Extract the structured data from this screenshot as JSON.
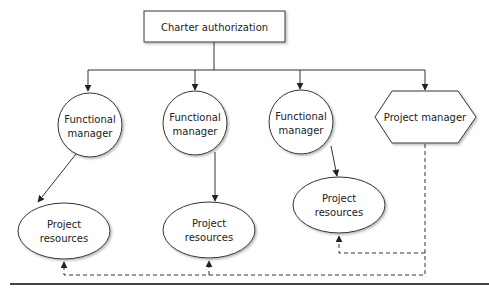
{
  "diagram": {
    "type": "organizational-flow",
    "top_node": {
      "label": "Charter authorization",
      "shape": "rectangle"
    },
    "managers": [
      {
        "label_line1": "Functional",
        "label_line2": "manager",
        "shape": "circle"
      },
      {
        "label_line1": "Functional",
        "label_line2": "manager",
        "shape": "circle"
      },
      {
        "label_line1": "Functional",
        "label_line2": "manager",
        "shape": "circle"
      },
      {
        "label": "Project manager",
        "shape": "hexagon"
      }
    ],
    "resources": [
      {
        "label_line1": "Project",
        "label_line2": "resources",
        "shape": "ellipse"
      },
      {
        "label_line1": "Project",
        "label_line2": "resources",
        "shape": "ellipse"
      },
      {
        "label_line1": "Project",
        "label_line2": "resources",
        "shape": "ellipse"
      }
    ],
    "edges": [
      {
        "from": "Charter authorization",
        "to": "Functional manager 1",
        "style": "solid"
      },
      {
        "from": "Charter authorization",
        "to": "Functional manager 2",
        "style": "solid"
      },
      {
        "from": "Charter authorization",
        "to": "Functional manager 3",
        "style": "solid"
      },
      {
        "from": "Charter authorization",
        "to": "Project manager",
        "style": "solid"
      },
      {
        "from": "Functional manager 1",
        "to": "Project resources 1",
        "style": "solid"
      },
      {
        "from": "Functional manager 2",
        "to": "Project resources 2",
        "style": "solid"
      },
      {
        "from": "Functional manager 3",
        "to": "Project resources 3",
        "style": "solid"
      },
      {
        "from": "Project manager",
        "to": "Project resources 1",
        "style": "dashed"
      },
      {
        "from": "Project manager",
        "to": "Project resources 2",
        "style": "dashed"
      },
      {
        "from": "Project manager",
        "to": "Project resources 3",
        "style": "dashed"
      }
    ]
  }
}
